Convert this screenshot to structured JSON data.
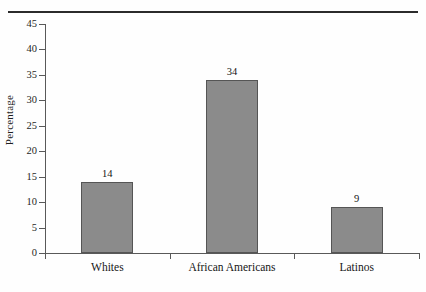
{
  "chart_data": {
    "type": "bar",
    "title": "",
    "xlabel": "",
    "ylabel": "Percentage",
    "categories": [
      "Whites",
      "African Americans",
      "Latinos"
    ],
    "values": [
      14,
      34,
      9
    ],
    "value_labels": [
      "14",
      "34",
      "9"
    ],
    "ylim": [
      0,
      45
    ],
    "ytick_step": 5,
    "yticks": [
      0,
      5,
      10,
      15,
      20,
      25,
      30,
      35,
      40,
      45
    ],
    "ytick_labels": [
      "0",
      "5",
      "10",
      "15",
      "20",
      "25",
      "30",
      "35",
      "40",
      "45"
    ],
    "grid": false,
    "legend": false,
    "legend_position": "none",
    "bar_fill_color": "#8b8b8b",
    "bar_edge_color": "#555555",
    "axis_color": "#595959",
    "background_color": "#fefefe"
  },
  "page": {
    "top_rule": ""
  }
}
